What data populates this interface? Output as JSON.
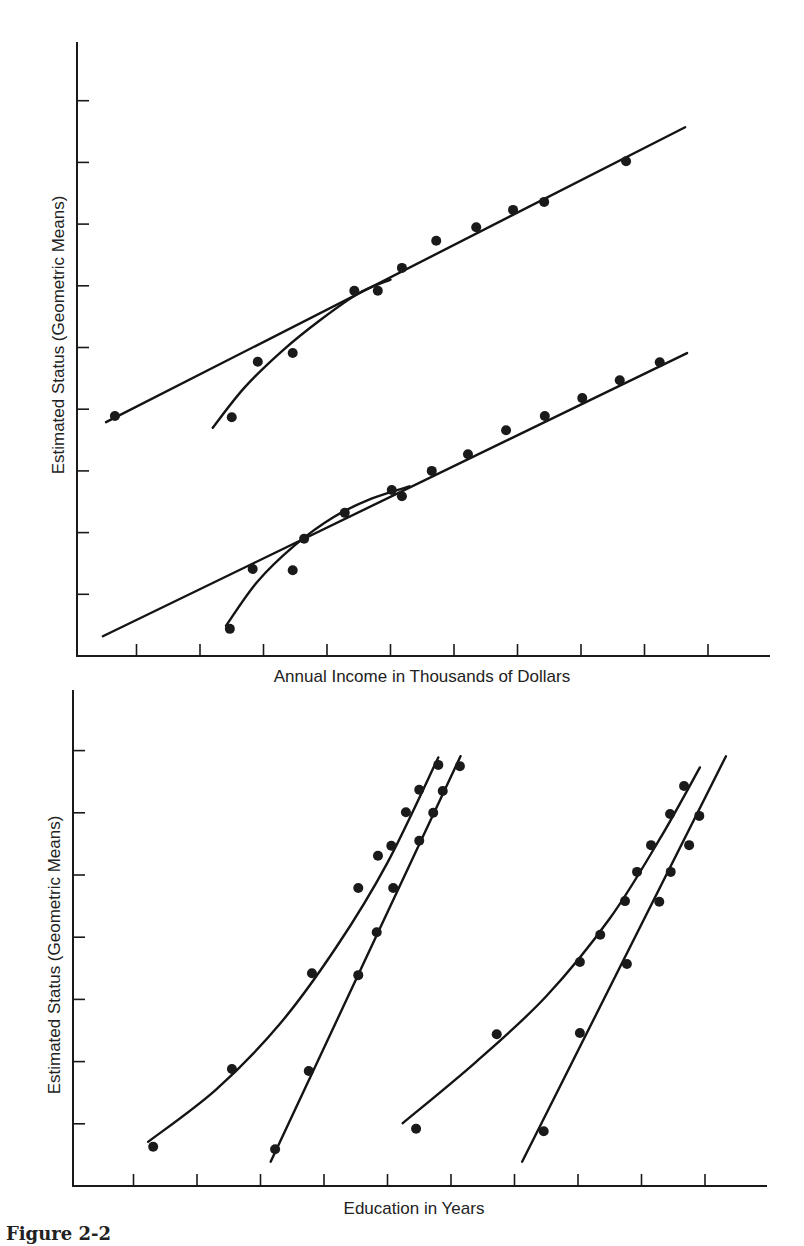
{
  "caption": "Figure 2-2",
  "chart_data": [
    {
      "type": "scatter",
      "title": "",
      "xlabel": "Annual Income in Thousands of Dollars",
      "ylabel": "Estimated Status (Geometric Means)",
      "x_ticks": [
        1,
        2,
        3,
        4,
        5,
        6,
        7,
        8,
        9,
        10
      ],
      "y_ticks": [
        1,
        2,
        3,
        4,
        5,
        6,
        7,
        8,
        9
      ],
      "tick_labels_shown": false,
      "xlim": [
        0,
        11.2
      ],
      "ylim": [
        0,
        9.9
      ],
      "grid": false,
      "series": [
        {
          "name": "upper-points",
          "points": [
            [
              0.66,
              3.89
            ],
            [
              2.5,
              3.87
            ],
            [
              2.91,
              4.77
            ],
            [
              3.46,
              4.91
            ],
            [
              4.43,
              5.92
            ],
            [
              4.8,
              5.92
            ],
            [
              5.18,
              6.29
            ],
            [
              5.72,
              6.73
            ],
            [
              6.35,
              6.95
            ],
            [
              6.93,
              7.23
            ],
            [
              7.42,
              7.36
            ],
            [
              8.71,
              8.02
            ]
          ]
        },
        {
          "name": "lower-points",
          "points": [
            [
              2.47,
              0.44
            ],
            [
              2.83,
              1.41
            ],
            [
              3.46,
              1.39
            ],
            [
              3.64,
              1.9
            ],
            [
              4.28,
              2.32
            ],
            [
              5.02,
              2.69
            ],
            [
              5.18,
              2.59
            ],
            [
              5.65,
              3.0
            ],
            [
              6.22,
              3.27
            ],
            [
              6.82,
              3.66
            ],
            [
              7.43,
              3.89
            ],
            [
              8.02,
              4.18
            ],
            [
              8.61,
              4.47
            ],
            [
              9.24,
              4.76
            ]
          ]
        }
      ],
      "fits": [
        {
          "name": "upper-linear-fit",
          "kind": "line",
          "points": [
            [
              0.52,
              3.79
            ],
            [
              9.64,
              8.57
            ]
          ]
        },
        {
          "name": "upper-log-fit",
          "kind": "curve",
          "points": [
            [
              2.2,
              3.7
            ],
            [
              2.7,
              4.35
            ],
            [
              3.3,
              4.95
            ],
            [
              3.9,
              5.45
            ],
            [
              4.5,
              5.88
            ],
            [
              5.0,
              6.1
            ]
          ]
        },
        {
          "name": "lower-linear-fit",
          "kind": "line",
          "points": [
            [
              0.47,
              0.32
            ],
            [
              9.67,
              4.91
            ]
          ]
        },
        {
          "name": "lower-log-fit",
          "kind": "curve",
          "points": [
            [
              2.41,
              0.49
            ],
            [
              2.9,
              1.2
            ],
            [
              3.5,
              1.8
            ],
            [
              4.1,
              2.25
            ],
            [
              4.7,
              2.55
            ],
            [
              5.3,
              2.75
            ]
          ]
        }
      ]
    },
    {
      "type": "scatter",
      "title": "",
      "xlabel": "Education in Years",
      "ylabel": "Estimated Status (Geometric Means)",
      "x_ticks": [
        1,
        2,
        3,
        4,
        5,
        6,
        7,
        8,
        9,
        10
      ],
      "y_ticks": [
        1,
        2,
        3,
        4,
        5,
        6,
        7
      ],
      "tick_labels_shown": false,
      "xlim": [
        0,
        11.2
      ],
      "ylim": [
        0,
        7.9
      ],
      "grid": false,
      "series": [
        {
          "name": "left-curve-points",
          "points": [
            [
              1.31,
              0.63
            ],
            [
              2.55,
              1.88
            ],
            [
              3.81,
              3.42
            ],
            [
              4.54,
              4.79
            ],
            [
              4.85,
              5.31
            ],
            [
              5.06,
              5.47
            ],
            [
              5.29,
              6.01
            ],
            [
              5.5,
              6.37
            ],
            [
              5.8,
              6.77
            ]
          ]
        },
        {
          "name": "left-line-points",
          "points": [
            [
              3.23,
              0.59
            ],
            [
              3.76,
              1.85
            ],
            [
              4.54,
              3.39
            ],
            [
              4.83,
              4.08
            ],
            [
              5.09,
              4.79
            ],
            [
              5.5,
              5.55
            ],
            [
              5.72,
              6.0
            ],
            [
              5.87,
              6.35
            ],
            [
              6.14,
              6.75
            ]
          ]
        },
        {
          "name": "right-curve-points",
          "points": [
            [
              5.45,
              0.92
            ],
            [
              6.72,
              2.44
            ],
            [
              8.03,
              3.6
            ],
            [
              8.35,
              4.04
            ],
            [
              8.74,
              4.58
            ],
            [
              8.93,
              5.05
            ],
            [
              9.15,
              5.48
            ],
            [
              9.45,
              5.98
            ],
            [
              9.67,
              6.43
            ]
          ]
        },
        {
          "name": "right-line-points",
          "points": [
            [
              7.46,
              0.88
            ],
            [
              8.03,
              2.46
            ],
            [
              8.77,
              3.57
            ],
            [
              9.28,
              4.57
            ],
            [
              9.46,
              5.05
            ],
            [
              9.75,
              5.48
            ],
            [
              9.91,
              5.95
            ]
          ]
        }
      ],
      "fits": [
        {
          "name": "left-curve-fit",
          "kind": "curve",
          "points": [
            [
              1.23,
              0.71
            ],
            [
              2.3,
              1.55
            ],
            [
              3.3,
              2.6
            ],
            [
              4.2,
              3.85
            ],
            [
              5.0,
              5.2
            ],
            [
              5.8,
              6.89
            ]
          ]
        },
        {
          "name": "left-line-fit",
          "kind": "line",
          "points": [
            [
              3.16,
              0.39
            ],
            [
              6.15,
              6.91
            ]
          ]
        },
        {
          "name": "right-curve-fit",
          "kind": "curve",
          "points": [
            [
              5.24,
              1.01
            ],
            [
              6.4,
              2.0
            ],
            [
              7.5,
              3.05
            ],
            [
              8.5,
              4.3
            ],
            [
              9.3,
              5.6
            ],
            [
              9.92,
              6.73
            ]
          ]
        },
        {
          "name": "right-line-fit",
          "kind": "line",
          "points": [
            [
              7.12,
              0.39
            ],
            [
              10.33,
              6.91
            ]
          ]
        }
      ]
    }
  ]
}
